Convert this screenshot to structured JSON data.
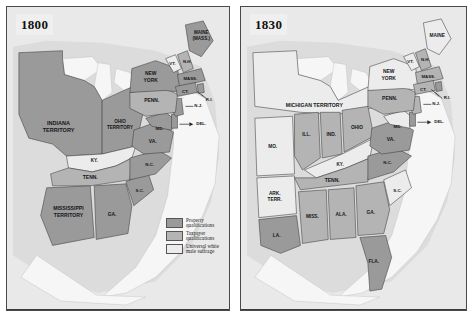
{
  "figure": {
    "panels": [
      {
        "id": "map-1800",
        "year": "1800",
        "legend": [
          {
            "swatch": "property",
            "line1": "Property",
            "line2": "qualifications",
            "color": "#9a9a9a"
          },
          {
            "swatch": "taxpayer",
            "line1": "Taxpayer",
            "line2": "qualifications",
            "color": "#b4b4b4"
          },
          {
            "swatch": "universal",
            "line1": "Universal white",
            "line2": "male suffrage",
            "color": "#ececec"
          }
        ],
        "labels": [
          {
            "name": "indiana-territory",
            "line1": "INDIANA",
            "line2": "TERRITORY",
            "category": "property"
          },
          {
            "name": "ohio-territory",
            "line1": "OHIO",
            "line2": "TERRITORY",
            "category": "property"
          },
          {
            "name": "kentucky",
            "line1": "KY.",
            "line2": "",
            "category": "universal"
          },
          {
            "name": "tennessee",
            "line1": "TENN.",
            "line2": "",
            "category": "taxpayer"
          },
          {
            "name": "mississippi-territory",
            "line1": "MISSISSIPPI",
            "line2": "TERRITORY",
            "category": "property"
          },
          {
            "name": "georgia",
            "line1": "GA.",
            "line2": "",
            "category": "property"
          },
          {
            "name": "south-carolina",
            "line1": "S.C.",
            "line2": "",
            "category": "property"
          },
          {
            "name": "north-carolina",
            "line1": "N.C.",
            "line2": "",
            "category": "property"
          },
          {
            "name": "virginia",
            "line1": "VA.",
            "line2": "",
            "category": "property"
          },
          {
            "name": "maryland",
            "line1": "MD.",
            "line2": "",
            "category": "property"
          },
          {
            "name": "delaware",
            "line1": "DEL.",
            "line2": "",
            "category": "property"
          },
          {
            "name": "new-jersey",
            "line1": "N.J.",
            "line2": "",
            "category": "property"
          },
          {
            "name": "pennsylvania",
            "line1": "PENN.",
            "line2": "",
            "category": "taxpayer"
          },
          {
            "name": "new-york",
            "line1": "NEW",
            "line2": "YORK",
            "category": "property"
          },
          {
            "name": "vermont",
            "line1": "VT.",
            "line2": "",
            "category": "universal"
          },
          {
            "name": "new-hampshire",
            "line1": "N.H.",
            "line2": "",
            "category": "taxpayer"
          },
          {
            "name": "massachusetts",
            "line1": "MASS.",
            "line2": "",
            "category": "property"
          },
          {
            "name": "connecticut",
            "line1": "CT.",
            "line2": "",
            "category": "property"
          },
          {
            "name": "rhode-island",
            "line1": "R.I.",
            "line2": "",
            "category": "property"
          },
          {
            "name": "maine-district",
            "line1": "MAINE",
            "line2": "(MASS.)",
            "category": "property"
          }
        ]
      },
      {
        "id": "map-1830",
        "year": "1830",
        "legend": [
          {
            "swatch": "property",
            "line1": "Property",
            "line2": "qualifications",
            "color": "#9a9a9a"
          },
          {
            "swatch": "taxpayer",
            "line1": "Taxpayer",
            "line2": "qualification",
            "color": "#b4b4b4"
          },
          {
            "swatch": "universal",
            "line1": "Universal white",
            "line2": "male suffrage",
            "color": "#ececec"
          }
        ],
        "labels": [
          {
            "name": "michigan-territory",
            "line1": "MICHIGAN  TERRITORY",
            "line2": "",
            "category": "universal"
          },
          {
            "name": "missouri",
            "line1": "MO.",
            "line2": "",
            "category": "universal"
          },
          {
            "name": "illinois",
            "line1": "ILL.",
            "line2": "",
            "category": "taxpayer"
          },
          {
            "name": "indiana",
            "line1": "IND.",
            "line2": "",
            "category": "taxpayer"
          },
          {
            "name": "ohio",
            "line1": "OHIO",
            "line2": "",
            "category": "taxpayer"
          },
          {
            "name": "kentucky",
            "line1": "KY.",
            "line2": "",
            "category": "universal"
          },
          {
            "name": "arkansas-territory",
            "line1": "ARK.",
            "line2": "TERR.",
            "category": "universal"
          },
          {
            "name": "tennessee",
            "line1": "TENN.",
            "line2": "",
            "category": "taxpayer"
          },
          {
            "name": "mississippi",
            "line1": "MISS.",
            "line2": "",
            "category": "taxpayer"
          },
          {
            "name": "alabama",
            "line1": "ALA.",
            "line2": "",
            "category": "taxpayer"
          },
          {
            "name": "georgia",
            "line1": "GA.",
            "line2": "",
            "category": "taxpayer"
          },
          {
            "name": "louisiana",
            "line1": "LA.",
            "line2": "",
            "category": "property"
          },
          {
            "name": "florida",
            "line1": "FLA.",
            "line2": "",
            "category": "property"
          },
          {
            "name": "south-carolina",
            "line1": "S.C.",
            "line2": "",
            "category": "universal"
          },
          {
            "name": "north-carolina",
            "line1": "N.C.",
            "line2": "",
            "category": "property"
          },
          {
            "name": "virginia",
            "line1": "VA.",
            "line2": "",
            "category": "property"
          },
          {
            "name": "maryland",
            "line1": "MD.",
            "line2": "",
            "category": "universal"
          },
          {
            "name": "delaware",
            "line1": "DEL.",
            "line2": "",
            "category": "property"
          },
          {
            "name": "new-jersey",
            "line1": "N.J.",
            "line2": "",
            "category": "taxpayer"
          },
          {
            "name": "pennsylvania",
            "line1": "PENN.",
            "line2": "",
            "category": "taxpayer"
          },
          {
            "name": "new-york",
            "line1": "NEW",
            "line2": "YORK",
            "category": "universal"
          },
          {
            "name": "vermont",
            "line1": "VT.",
            "line2": "",
            "category": "universal"
          },
          {
            "name": "new-hampshire",
            "line1": "N.H.",
            "line2": "",
            "category": "taxpayer"
          },
          {
            "name": "massachusetts",
            "line1": "MASS.",
            "line2": "",
            "category": "taxpayer"
          },
          {
            "name": "connecticut",
            "line1": "CT.",
            "line2": "",
            "category": "taxpayer"
          },
          {
            "name": "rhode-island",
            "line1": "R.I.",
            "line2": "",
            "category": "property"
          },
          {
            "name": "maine",
            "line1": "MAINE",
            "line2": "",
            "category": "universal"
          }
        ]
      }
    ],
    "colors": {
      "property": "#9a9a9a",
      "taxpayer": "#b4b4b4",
      "universal": "#ececec",
      "water": "#f4f4f4",
      "background": "#e9e9e9",
      "border": "#4a4a4a"
    }
  }
}
